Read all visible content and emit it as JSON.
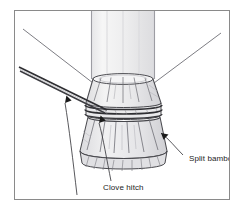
{
  "figure": {
    "type": "line-drawing",
    "frame": {
      "border_color": "#8a8a8a",
      "background": "#ffffff"
    }
  },
  "labels": {
    "split_bamboo": "Split bamboo",
    "clove_hitch": "Clove hitch",
    "bridle_rear_leg": "Bridle (rear leg)"
  },
  "colors": {
    "ink": "#1b1b1b",
    "line": "#55555a",
    "light_line": "#9a9aa0",
    "pole_fill": "#f2f2f2",
    "pole_shade": "#e2e2e4",
    "collar_fill": "#ededee",
    "collar_shade": "#d9d9dc",
    "rope": "#3a3a3e",
    "page": "#ffffff"
  },
  "parts": {
    "pole": "vertical bamboo pole",
    "collar": "flared split bamboo collar",
    "binding": "clove hitch rope wraps",
    "skirt": "splayed split bamboo skirt",
    "bridle": "doubled bridle rope to rear leg",
    "guy_left": "thin guy line upper left",
    "guy_right": "thin guy line upper right"
  },
  "leaders": [
    {
      "name": "split-bamboo-leader",
      "target": "skirt"
    },
    {
      "name": "clove-hitch-leader",
      "target": "binding"
    },
    {
      "name": "bridle-leader",
      "target": "bridle"
    }
  ]
}
